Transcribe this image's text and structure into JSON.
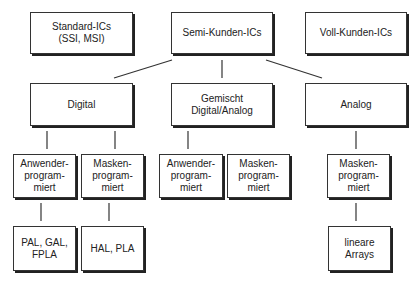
{
  "diagram": {
    "top": {
      "standard": "Standard-ICs\n(SSI, MSI)",
      "semi": "Semi-Kunden-ICs",
      "voll": "Voll-Kunden-ICs"
    },
    "level2": {
      "digital": "Digital",
      "gemischt": "Gemischt\nDigital/Analog",
      "analog": "Analog"
    },
    "level3": {
      "digital_anwender": "Anwender-\nprogram-\nmiert",
      "digital_masken": "Masken-\nprogram-\nmiert",
      "gemischt_anwender": "Anwender-\nprogram-\nmiert",
      "gemischt_masken": "Masken-\nprogram-\nmiert",
      "analog_masken": "Masken-\nprogram-\nmiert"
    },
    "level4": {
      "pal": "PAL, GAL,\nFPLA",
      "hal": "HAL, PLA",
      "lineare": "lineare\nArrays"
    }
  }
}
